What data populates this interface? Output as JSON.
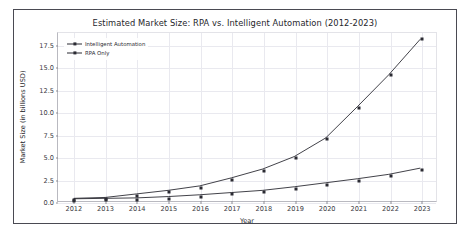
{
  "chart_data": {
    "type": "line",
    "title": "Estimated Market Size: RPA vs. Intelligent Automation (2012-2023)",
    "xlabel": "Year",
    "ylabel": "Market Size (in billions USD)",
    "categories": [
      "2012",
      "2013",
      "2014",
      "2015",
      "2016",
      "2017",
      "2018",
      "2019",
      "2020",
      "2021",
      "2022",
      "2023"
    ],
    "x": [
      2012,
      2013,
      2014,
      2015,
      2016,
      2017,
      2018,
      2019,
      2020,
      2021,
      2022,
      2023
    ],
    "xlim": [
      2011.5,
      2023.5
    ],
    "ylim": [
      0.0,
      18.9
    ],
    "yticks": [
      "0.0",
      "2.5",
      "5.0",
      "7.5",
      "10.0",
      "12.5",
      "15.0",
      "17.5"
    ],
    "ytick_values": [
      0.0,
      2.5,
      5.0,
      7.5,
      10.0,
      12.5,
      15.0,
      17.5
    ],
    "grid": true,
    "legend_position": "upper left",
    "series": [
      {
        "name": "Intelligent Automation",
        "marker": "square",
        "color": "#2b2b33",
        "values": [
          0.3,
          0.4,
          0.8,
          1.2,
          1.7,
          2.6,
          3.6,
          5.0,
          7.1,
          10.6,
          14.2,
          18.2
        ]
      },
      {
        "name": "RPA Only",
        "marker": "square",
        "color": "#2b2b33",
        "values": [
          0.25,
          0.3,
          0.35,
          0.5,
          0.7,
          0.95,
          1.2,
          1.6,
          2.05,
          2.5,
          3.0,
          3.7
        ]
      }
    ]
  }
}
